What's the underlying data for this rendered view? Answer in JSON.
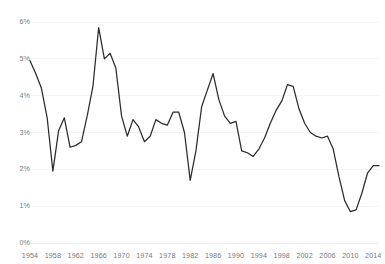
{
  "chart_data": {
    "type": "line",
    "title": "",
    "subtitle": "",
    "xlabel": "",
    "ylabel": "",
    "xlim": [
      1954,
      2015
    ],
    "ylim": [
      0,
      6
    ],
    "grid": true,
    "legend": false,
    "legend_position": "none",
    "y_ticks": [
      "0%",
      "1%",
      "2%",
      "3%",
      "4%",
      "5%",
      "6%"
    ],
    "y_tick_values": [
      0,
      1,
      2,
      3,
      4,
      5,
      6
    ],
    "x_ticks": [
      "1954",
      "1958",
      "1962",
      "1966",
      "1970",
      "1974",
      "1978",
      "1982",
      "1986",
      "1990",
      "1994",
      "1998",
      "2002",
      "2006",
      "2010",
      "2014"
    ],
    "x_tick_values": [
      1954,
      1958,
      1962,
      1966,
      1970,
      1974,
      1978,
      1982,
      1986,
      1990,
      1994,
      1998,
      2002,
      2006,
      2010,
      2014
    ],
    "line_color": "#2b2b2b",
    "grid_color": "#efefef",
    "background_color": "#ffffff",
    "series": [
      {
        "name": "rate",
        "x": [
          1954,
          1955,
          1956,
          1957,
          1958,
          1959,
          1960,
          1961,
          1962,
          1963,
          1964,
          1965,
          1966,
          1967,
          1968,
          1969,
          1970,
          1971,
          1972,
          1973,
          1974,
          1975,
          1976,
          1977,
          1978,
          1979,
          1980,
          1981,
          1982,
          1983,
          1984,
          1985,
          1986,
          1987,
          1988,
          1989,
          1990,
          1991,
          1992,
          1993,
          1994,
          1995,
          1996,
          1997,
          1998,
          1999,
          2000,
          2001,
          2002,
          2003,
          2004,
          2005,
          2006,
          2007,
          2008,
          2009,
          2010,
          2011,
          2012,
          2013,
          2014,
          2015
        ],
        "values": [
          4.95,
          4.6,
          4.2,
          3.4,
          1.95,
          3.05,
          3.4,
          2.6,
          2.65,
          2.75,
          3.45,
          4.25,
          5.85,
          5.0,
          5.15,
          4.75,
          3.45,
          2.9,
          3.35,
          3.15,
          2.75,
          2.9,
          3.35,
          3.25,
          3.2,
          3.55,
          3.55,
          3.0,
          1.7,
          2.5,
          3.7,
          4.15,
          4.6,
          3.9,
          3.45,
          3.25,
          3.3,
          2.5,
          2.45,
          2.35,
          2.55,
          2.85,
          3.25,
          3.6,
          3.85,
          4.3,
          4.25,
          3.65,
          3.25,
          3.0,
          2.9,
          2.85,
          2.9,
          2.55,
          1.8,
          1.15,
          0.85,
          0.9,
          1.35,
          1.9,
          2.1,
          2.1
        ]
      }
    ]
  },
  "axis": {
    "y_label_0": "0%",
    "y_label_1": "1%",
    "y_label_2": "2%",
    "y_label_3": "3%",
    "y_label_4": "4%",
    "y_label_5": "5%",
    "y_label_6": "6%"
  }
}
